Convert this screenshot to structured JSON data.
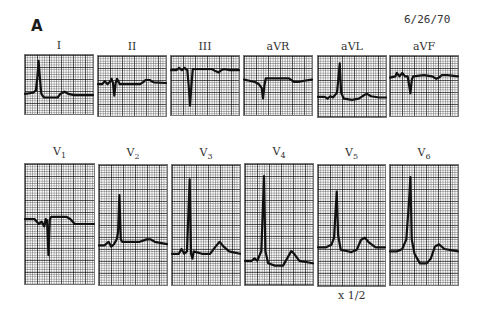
{
  "figure": {
    "label": "A",
    "date": "6/26/70",
    "scale_note": "x 1/2"
  },
  "limb_leads": [
    {
      "name": "I",
      "sub": "",
      "box": {
        "x": 24,
        "y": 54,
        "w": 70,
        "h": 61
      },
      "trace": "0,66 12,64 16,60 18,40 20,10 22,40 24,66 28,72 40,72 48,72 52,66 58,62 64,66 72,68 84,68 100,68"
    },
    {
      "name": "II",
      "sub": "",
      "box": {
        "x": 97,
        "y": 55,
        "w": 70,
        "h": 62
      },
      "trace": "0,47 6,47 10,42 14,47 18,42 20,38 22,45 24,66 26,45 28,38 32,47 50,47 62,47 66,44 70,40 76,40 82,44 100,45"
    },
    {
      "name": "III",
      "sub": "",
      "box": {
        "x": 170,
        "y": 55,
        "w": 70,
        "h": 61
      },
      "trace": "0,24 8,24 12,20 16,24 20,20 24,24 26,50 28,84 30,50 32,22 48,22 60,22 66,26 70,28 74,24 78,22 86,24 100,24"
    },
    {
      "name": "aVR",
      "sub": "",
      "box": {
        "x": 243,
        "y": 55,
        "w": 70,
        "h": 61
      },
      "trace": "0,40 8,42 16,44 22,48 26,54 28,72 30,50 32,38 46,38 66,38 74,44 80,44 88,42 100,40"
    },
    {
      "name": "aVL",
      "sub": "",
      "box": {
        "x": 317,
        "y": 55,
        "w": 70,
        "h": 63
      },
      "trace": "0,67 10,67 14,70 18,66 22,68 28,60 32,12 34,60 38,70 50,72 60,70 68,64 72,62 78,66 90,68 100,68"
    },
    {
      "name": "aVF",
      "sub": "",
      "box": {
        "x": 389,
        "y": 55,
        "w": 70,
        "h": 62
      },
      "trace": "0,36 8,34 10,28 14,34 18,28 22,34 26,34 28,48 30,62 32,40 34,34 50,32 62,34 68,38 72,36 76,32 84,32 100,34"
    }
  ],
  "chest_leads": [
    {
      "name": "V",
      "sub": "1",
      "box": {
        "x": 24,
        "y": 163,
        "w": 71,
        "h": 122
      },
      "trace": "0,46 14,46 20,50 24,48 28,52 30,46 32,47 34,76 36,46 38,44 60,44 66,46 72,50 100,50"
    },
    {
      "name": "V",
      "sub": "2",
      "box": {
        "x": 98,
        "y": 164,
        "w": 70,
        "h": 122
      },
      "trace": "0,67 8,67 14,64 18,68 22,66 26,62 28,56 30,25 32,62 34,64 60,64 70,62 76,62 82,64 100,66"
    },
    {
      "name": "V",
      "sub": "3",
      "box": {
        "x": 171,
        "y": 164,
        "w": 70,
        "h": 122
      },
      "trace": "0,74 10,74 14,70 18,74 22,72 24,42 26,12 28,74 30,78 32,72 44,74 56,74 64,68 70,64 76,68 84,72 100,74"
    },
    {
      "name": "V",
      "sub": "4",
      "box": {
        "x": 244,
        "y": 163,
        "w": 70,
        "h": 123
      },
      "trace": "0,80 10,80 14,78 18,80 24,72 28,10 30,72 34,82 44,84 56,84 62,78 68,72 72,74 80,80 100,82"
    },
    {
      "name": "V",
      "sub": "5",
      "box": {
        "x": 317,
        "y": 164,
        "w": 69,
        "h": 123
      },
      "trace": "0,68 12,68 20,66 24,60 26,40 28,22 30,58 34,70 50,72 58,70 64,62 70,60 76,64 86,68 100,68"
    },
    {
      "name": "V",
      "sub": "6",
      "box": {
        "x": 389,
        "y": 164,
        "w": 70,
        "h": 122
      },
      "trace": "0,72 10,72 18,70 24,62 28,30 30,10 32,62 36,74 44,82 54,82 60,78 66,68 72,66 80,70 100,72"
    }
  ],
  "colors": {
    "ink": "#111111",
    "paper": "#fbfbfb",
    "grid_major": "#555555",
    "grid_minor": "#999999"
  }
}
